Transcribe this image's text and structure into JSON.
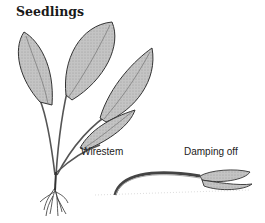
{
  "figure": {
    "title": "Seedlings",
    "labels": {
      "wirestem": "Wirestem",
      "damping_off": "Damping off"
    },
    "colors": {
      "leaf_fill": "#b8b8b8",
      "outline": "#3a3a3a",
      "background": "#ffffff"
    }
  }
}
